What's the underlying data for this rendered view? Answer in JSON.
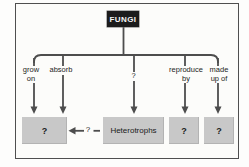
{
  "concept_map": {
    "title_box": "FUNGI",
    "branch_labels": [
      {
        "line1": "grow",
        "line2": "on"
      },
      {
        "line1": "absorb"
      },
      {
        "line1": "?"
      },
      {
        "line1": "reproduce",
        "line2": "by"
      },
      {
        "line1": "made",
        "line2": "up of"
      }
    ],
    "bottom_boxes": [
      {
        "label": "?"
      },
      {
        "label": "Heterotrophs"
      },
      {
        "label": "?"
      },
      {
        "label": "?"
      }
    ],
    "cross_link_label": "?",
    "colors": {
      "root_box_fill": "#1c1c1c",
      "root_box_text": "#f6f6f6",
      "gray_box_fill": "#c8c8c8",
      "line_color": "#4d4d4d",
      "frame_border": "#4f4f4f",
      "background": "#fcfcfa"
    }
  }
}
